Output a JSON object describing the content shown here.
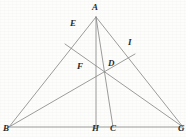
{
  "figure": {
    "type": "geometry-diagram",
    "width": 186,
    "height": 137,
    "background_color": "#fdfdfb",
    "line_color": "#8a8a8a",
    "label_color": "#2b2b2b",
    "points": [
      {
        "id": "A",
        "label": "A",
        "x": 96,
        "y": 17,
        "label_x": 92,
        "label_y": 3,
        "role": "apex-vertex"
      },
      {
        "id": "B",
        "label": "B",
        "x": 9,
        "y": 127,
        "label_x": 3,
        "label_y": 124,
        "role": "base-left-vertex"
      },
      {
        "id": "G",
        "label": "G",
        "x": 183,
        "y": 127,
        "label_x": 178,
        "label_y": 124,
        "role": "base-right-vertex"
      },
      {
        "id": "E",
        "label": "E",
        "x": 65,
        "y": 44,
        "label_x": 70,
        "label_y": 19,
        "role": "point-on-side-AB"
      },
      {
        "id": "I",
        "label": "I",
        "x": 135,
        "y": 54,
        "label_x": 128,
        "label_y": 38,
        "role": "point-on-side-AG"
      },
      {
        "id": "F",
        "label": "F",
        "x": 95,
        "y": 68,
        "label_x": 77,
        "label_y": 62,
        "role": "cevian-intersection"
      },
      {
        "id": "D",
        "label": "D",
        "x": 105,
        "y": 65,
        "label_x": 108,
        "label_y": 59,
        "role": "point-on-cevian-AC"
      },
      {
        "id": "H",
        "label": "H",
        "x": 96,
        "y": 127,
        "label_x": 92,
        "label_y": 124,
        "role": "foot-of-altitude"
      },
      {
        "id": "C",
        "label": "C",
        "x": 113,
        "y": 127,
        "label_x": 110,
        "label_y": 124,
        "role": "point-on-base"
      }
    ],
    "segments": [
      {
        "id": "AB",
        "from": "A",
        "to": "B",
        "name": "side-ab"
      },
      {
        "id": "AG",
        "from": "A",
        "to": "G",
        "name": "side-ag"
      },
      {
        "id": "BG",
        "from": "B",
        "to": "G",
        "name": "base-bg"
      },
      {
        "id": "AH",
        "from": "A",
        "to": "H",
        "name": "altitude-ah"
      },
      {
        "id": "AC",
        "from": "A",
        "to": "C",
        "name": "cevian-ac"
      },
      {
        "id": "BI",
        "from": "B",
        "to": "I",
        "name": "cevian-bi"
      },
      {
        "id": "EG",
        "from": "E",
        "to": "G",
        "name": "cevian-eg"
      }
    ],
    "labels_order": [
      "A",
      "E",
      "I",
      "F",
      "D",
      "B",
      "H",
      "C",
      "G"
    ]
  }
}
